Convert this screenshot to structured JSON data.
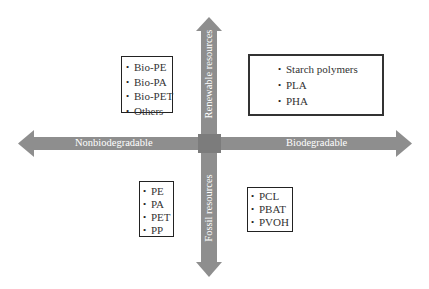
{
  "diagram": {
    "title": "",
    "colors": {
      "arrow": "#8e8e8e",
      "center": "#7c7c7c",
      "label_text": "#ffffff",
      "box_border": "#222222"
    },
    "axes": {
      "left_label": "Nonbiodegradable",
      "right_label": "Biodegradable",
      "top_label": "Renewable resources",
      "bottom_label": "Fossil resources"
    },
    "quadrants": {
      "top_left": {
        "items": [
          "Bio-PE",
          "Bio-PA",
          "Bio-PET",
          "Others"
        ]
      },
      "top_right": {
        "items": [
          "Starch polymers",
          "PLA",
          "PHA"
        ]
      },
      "bottom_left": {
        "items": [
          "PE",
          "PA",
          "PET",
          "PP"
        ]
      },
      "bottom_right": {
        "items": [
          "PCL",
          "PBAT",
          "PVOH"
        ]
      }
    }
  }
}
